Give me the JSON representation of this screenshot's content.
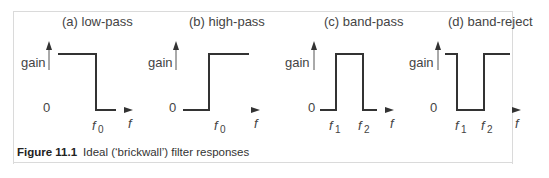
{
  "panels": [
    {
      "label": "(a)  low-pass",
      "y_label": "gain",
      "zero": "0",
      "x_label": "f",
      "ticks": [
        "f0"
      ]
    },
    {
      "label": "(b)  high-pass",
      "y_label": "gain",
      "zero": "0",
      "x_label": "f",
      "ticks": [
        "f0"
      ]
    },
    {
      "label": "(c)  band-pass",
      "y_label": "gain",
      "zero": "0",
      "x_label": "f",
      "ticks": [
        "f1",
        "f2"
      ]
    },
    {
      "label": "(d)  band-reject",
      "y_label": "gain",
      "zero": "0",
      "x_label": "f",
      "ticks": [
        "f1",
        "f2"
      ]
    }
  ],
  "caption": {
    "number": "Figure 11.1",
    "text": "Ideal (‘brickwall’) filter responses"
  },
  "colors": {
    "line": "#333333",
    "axis": "#555555",
    "text": "#444444"
  }
}
